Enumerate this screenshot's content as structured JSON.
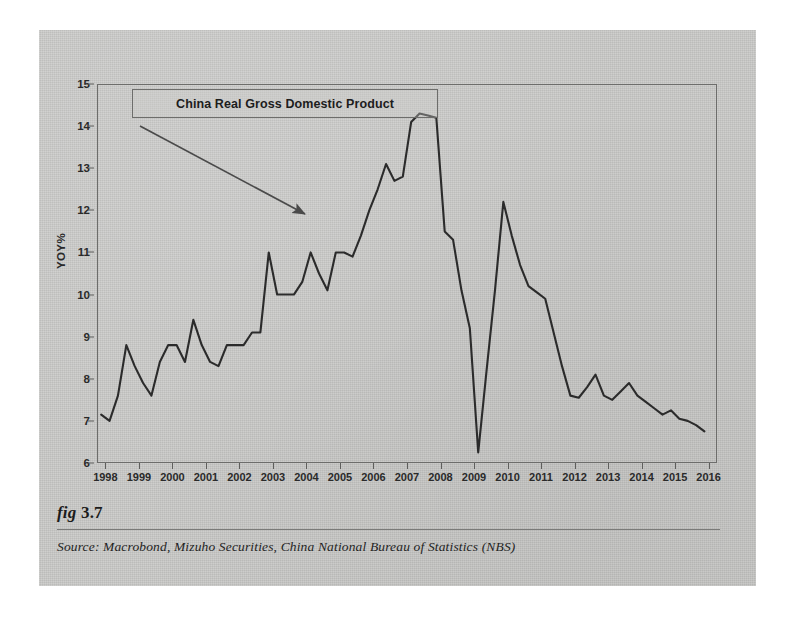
{
  "figure": {
    "number_label": "fig",
    "number_value": "3.7",
    "source": "Source:  Macrobond, Mizuho Securities, China National Bureau of Statistics (NBS)"
  },
  "chart_data": {
    "type": "line",
    "title": "China Real Gross Domestic Product",
    "xlabel": "",
    "ylabel": "YOY%",
    "ylim": [
      6,
      15
    ],
    "xlim": [
      1997.75,
      2016.25
    ],
    "grid": false,
    "legend_position": "top-left-box",
    "line_color": "#2b2b2b",
    "y_ticks": [
      6,
      7,
      8,
      9,
      10,
      11,
      12,
      13,
      14,
      15
    ],
    "x_ticks": [
      1998,
      1999,
      2000,
      2001,
      2002,
      2003,
      2004,
      2005,
      2006,
      2007,
      2008,
      2009,
      2010,
      2011,
      2012,
      2013,
      2014,
      2015,
      2016
    ],
    "annotation": {
      "text": "China Real Gross Domestic Product",
      "arrow_from_x": 1999.1,
      "arrow_from_y": 14.35,
      "arrow_to_x": 2003.65,
      "arrow_to_y": 12.55
    },
    "series": [
      {
        "name": "China Real Gross Domestic Product",
        "x": [
          1997.875,
          1998.125,
          1998.375,
          1998.625,
          1998.875,
          1999.125,
          1999.375,
          1999.625,
          1999.875,
          2000.125,
          2000.375,
          2000.625,
          2000.875,
          2001.125,
          2001.375,
          2001.625,
          2001.875,
          2002.125,
          2002.375,
          2002.625,
          2002.875,
          2003.125,
          2003.375,
          2003.625,
          2003.875,
          2004.125,
          2004.375,
          2004.625,
          2004.875,
          2005.125,
          2005.375,
          2005.625,
          2005.875,
          2006.125,
          2006.375,
          2006.625,
          2006.875,
          2007.125,
          2007.375,
          2007.625,
          2007.875,
          2008.125,
          2008.375,
          2008.625,
          2008.875,
          2009.125,
          2009.375,
          2009.625,
          2009.875,
          2010.125,
          2010.375,
          2010.625,
          2010.875,
          2011.125,
          2011.375,
          2011.625,
          2011.875,
          2012.125,
          2012.375,
          2012.625,
          2012.875,
          2013.125,
          2013.375,
          2013.625,
          2013.875,
          2014.125,
          2014.375,
          2014.625,
          2014.875,
          2015.125,
          2015.375,
          2015.625,
          2015.875
        ],
        "y": [
          7.15,
          7.0,
          7.6,
          8.8,
          8.3,
          7.9,
          7.6,
          8.4,
          8.8,
          8.8,
          8.4,
          9.4,
          8.8,
          8.4,
          8.3,
          8.8,
          8.8,
          8.8,
          9.1,
          9.1,
          11.0,
          10.0,
          10.0,
          10.0,
          10.3,
          11.0,
          10.5,
          10.1,
          11.0,
          11.0,
          10.9,
          11.4,
          12.0,
          12.5,
          13.1,
          12.7,
          12.8,
          14.1,
          14.3,
          14.25,
          14.2,
          11.5,
          11.3,
          10.1,
          9.2,
          6.25,
          8.2,
          10.1,
          12.2,
          11.4,
          10.7,
          10.2,
          10.05,
          9.9,
          9.1,
          8.3,
          7.6,
          7.55,
          7.8,
          8.1,
          7.6,
          7.5,
          7.7,
          7.9,
          7.6,
          7.45,
          7.3,
          7.15,
          7.25,
          7.05,
          7.0,
          6.9,
          6.75
        ]
      }
    ]
  }
}
